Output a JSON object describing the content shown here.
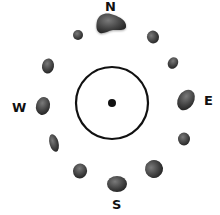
{
  "diagram": {
    "directions": {
      "north": "N",
      "east": "E",
      "south": "S",
      "west": "W"
    },
    "center_marker": "center-dot",
    "stone_count": 12,
    "colors": {
      "stone": "#3a3a3a",
      "stone_highlight": "#6a6a6a",
      "ring": "#111111",
      "label": "#111111"
    }
  }
}
